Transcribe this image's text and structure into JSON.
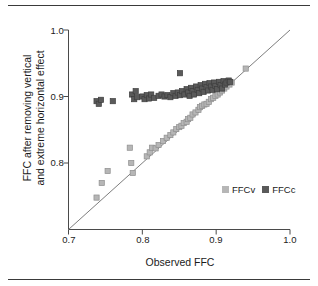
{
  "chart_data": {
    "type": "scatter",
    "title": "",
    "xlabel": "Observed FFC",
    "ylabel": "FFC after removing vertical and extreme horizontal effect",
    "ylabel_line1": "FFC after removing vertical",
    "ylabel_line2": "and extreme horizontal effect",
    "xlim": [
      0.7,
      1.0
    ],
    "ylim": [
      0.7,
      1.0
    ],
    "xticks": [
      0.7,
      0.8,
      0.9,
      1.0
    ],
    "yticks": [
      0.8,
      0.9,
      1.0
    ],
    "xtick_labels": [
      "0.7",
      "0.8",
      "0.9",
      "1.0"
    ],
    "ytick_labels": [
      "0.8",
      "0.9",
      "1.0"
    ],
    "grid": false,
    "legend_position": "inside-lower-right",
    "reference_line": {
      "type": "identity",
      "from": [
        0.7,
        0.7
      ],
      "to": [
        1.0,
        1.0
      ],
      "color": "#6e6e6e"
    },
    "marker": "square",
    "series": [
      {
        "name": "FFCv",
        "color": "#b6b6b6",
        "edge_color": "#8f8f8f",
        "points": [
          [
            0.738,
            0.748
          ],
          [
            0.745,
            0.77
          ],
          [
            0.753,
            0.788
          ],
          [
            0.783,
            0.823
          ],
          [
            0.785,
            0.8
          ],
          [
            0.787,
            0.785
          ],
          [
            0.806,
            0.81
          ],
          [
            0.81,
            0.816
          ],
          [
            0.813,
            0.823
          ],
          [
            0.818,
            0.822
          ],
          [
            0.822,
            0.827
          ],
          [
            0.828,
            0.833
          ],
          [
            0.833,
            0.838
          ],
          [
            0.838,
            0.842
          ],
          [
            0.842,
            0.846
          ],
          [
            0.846,
            0.851
          ],
          [
            0.85,
            0.854
          ],
          [
            0.853,
            0.856
          ],
          [
            0.856,
            0.86
          ],
          [
            0.86,
            0.862
          ],
          [
            0.862,
            0.866
          ],
          [
            0.865,
            0.868
          ],
          [
            0.868,
            0.873
          ],
          [
            0.872,
            0.876
          ],
          [
            0.876,
            0.88
          ],
          [
            0.878,
            0.884
          ],
          [
            0.881,
            0.886
          ],
          [
            0.884,
            0.888
          ],
          [
            0.887,
            0.889
          ],
          [
            0.89,
            0.892
          ],
          [
            0.893,
            0.896
          ],
          [
            0.896,
            0.898
          ],
          [
            0.899,
            0.901
          ],
          [
            0.902,
            0.903
          ],
          [
            0.905,
            0.906
          ],
          [
            0.908,
            0.909
          ],
          [
            0.911,
            0.912
          ],
          [
            0.914,
            0.915
          ],
          [
            0.918,
            0.918
          ],
          [
            0.921,
            0.921
          ],
          [
            0.94,
            0.942
          ]
        ]
      },
      {
        "name": "FFCc",
        "color": "#5a5a5a",
        "edge_color": "#3e3e3e",
        "points": [
          [
            0.738,
            0.893
          ],
          [
            0.741,
            0.889
          ],
          [
            0.744,
            0.895
          ],
          [
            0.76,
            0.893
          ],
          [
            0.786,
            0.903
          ],
          [
            0.789,
            0.896
          ],
          [
            0.791,
            0.908
          ],
          [
            0.793,
            0.899
          ],
          [
            0.8,
            0.9
          ],
          [
            0.803,
            0.896
          ],
          [
            0.806,
            0.902
          ],
          [
            0.809,
            0.897
          ],
          [
            0.812,
            0.903
          ],
          [
            0.816,
            0.898
          ],
          [
            0.822,
            0.901
          ],
          [
            0.826,
            0.903
          ],
          [
            0.83,
            0.9
          ],
          [
            0.834,
            0.902
          ],
          [
            0.838,
            0.899
          ],
          [
            0.842,
            0.905
          ],
          [
            0.845,
            0.901
          ],
          [
            0.848,
            0.906
          ],
          [
            0.851,
            0.902
          ],
          [
            0.851,
            0.935
          ],
          [
            0.854,
            0.908
          ],
          [
            0.857,
            0.903
          ],
          [
            0.86,
            0.911
          ],
          [
            0.862,
            0.906
          ],
          [
            0.864,
            0.901
          ],
          [
            0.866,
            0.913
          ],
          [
            0.868,
            0.908
          ],
          [
            0.87,
            0.903
          ],
          [
            0.873,
            0.915
          ],
          [
            0.875,
            0.91
          ],
          [
            0.877,
            0.905
          ],
          [
            0.879,
            0.917
          ],
          [
            0.881,
            0.912
          ],
          [
            0.883,
            0.907
          ],
          [
            0.885,
            0.919
          ],
          [
            0.887,
            0.914
          ],
          [
            0.889,
            0.909
          ],
          [
            0.891,
            0.92
          ],
          [
            0.893,
            0.915
          ],
          [
            0.895,
            0.91
          ],
          [
            0.897,
            0.921
          ],
          [
            0.899,
            0.916
          ],
          [
            0.901,
            0.911
          ],
          [
            0.904,
            0.922
          ],
          [
            0.906,
            0.917
          ],
          [
            0.908,
            0.912
          ],
          [
            0.91,
            0.923
          ],
          [
            0.912,
            0.918
          ],
          [
            0.914,
            0.921
          ],
          [
            0.917,
            0.924
          ],
          [
            0.919,
            0.922
          ]
        ]
      }
    ]
  },
  "axis": {
    "ytick_1": "1.0",
    "ytick_2": "0.9",
    "ytick_3": "0.8",
    "xtick_1": "0.7",
    "xtick_2": "0.8",
    "xtick_3": "0.9",
    "xtick_4": "1.0"
  },
  "legend": {
    "entries": [
      {
        "label": "FFCv",
        "color": "#b6b6b6"
      },
      {
        "label": "FFCc",
        "color": "#5a5a5a"
      }
    ]
  }
}
